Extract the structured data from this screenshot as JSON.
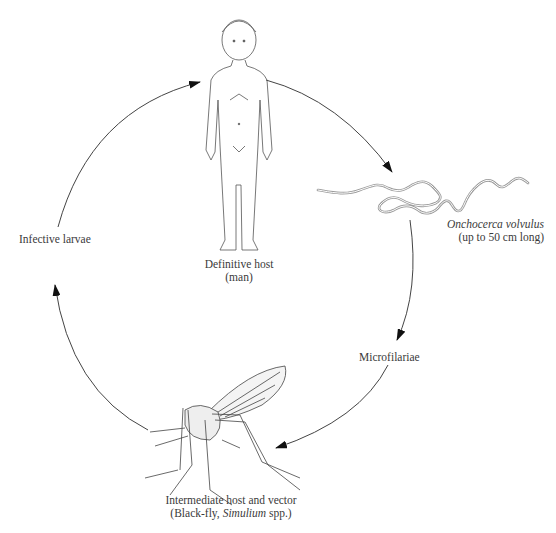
{
  "diagram": {
    "type": "life-cycle",
    "stages": [
      {
        "id": "definitive-host",
        "line1": "Definitive host",
        "line2": "(man)"
      },
      {
        "id": "adult-worm",
        "name_italic": "Onchocerca volvulus",
        "note": "(up to 50 cm long)"
      },
      {
        "id": "microfilariae",
        "label": "Microfilariae"
      },
      {
        "id": "vector",
        "line1": "Intermediate host and vector",
        "line2_prefix": "(Black-fly, ",
        "line2_italic": "Simulium",
        "line2_suffix": " spp.)"
      },
      {
        "id": "infective-larvae",
        "label": "Infective larvae"
      }
    ],
    "flow": [
      "definitive-host",
      "adult-worm",
      "microfilariae",
      "vector",
      "infective-larvae",
      "definitive-host"
    ],
    "colors": {
      "line": "#444444",
      "background": "#ffffff",
      "worm": "#9a9a9a"
    }
  }
}
